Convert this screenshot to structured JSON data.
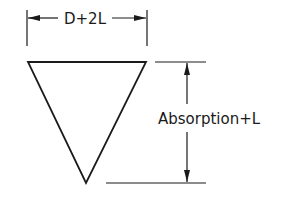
{
  "diagram": {
    "shape": "inverted-triangle",
    "width_label": "D+2L",
    "height_label": "Absorption+L",
    "stroke_color": "#1a1a1a",
    "background": "#ffffff"
  }
}
